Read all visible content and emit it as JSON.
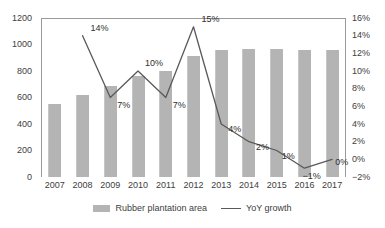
{
  "chart_data": {
    "type": "bar",
    "title": "",
    "xlabel": "",
    "ylabel": "",
    "grid": false,
    "legend_position": "bottom-center",
    "categories": [
      "2007",
      "2008",
      "2009",
      "2010",
      "2011",
      "2012",
      "2013",
      "2014",
      "2015",
      "2016",
      "2017"
    ],
    "axes": {
      "left": {
        "name": "Rubber plantation area",
        "min": 0,
        "max": 1200,
        "step": 200,
        "ticks": [
          "0",
          "200",
          "400",
          "600",
          "800",
          "1000",
          "1200"
        ]
      },
      "right": {
        "name": "YoY growth",
        "min": -2,
        "max": 16,
        "step": 2,
        "ticks": [
          "-2%",
          "0%",
          "2%",
          "4%",
          "6%",
          "8%",
          "10%",
          "12%",
          "14%",
          "16%"
        ]
      }
    },
    "series": [
      {
        "name": "Rubber plantation area",
        "type": "bar",
        "axis": "left",
        "color": "#b4b4b4",
        "values": [
          550,
          620,
          690,
          760,
          800,
          915,
          960,
          965,
          965,
          960,
          960
        ]
      },
      {
        "name": "YoY growth",
        "type": "line",
        "axis": "right",
        "color": "#595959",
        "values": [
          null,
          14,
          7,
          10,
          7,
          15,
          4,
          2,
          1,
          -1,
          0
        ],
        "data_labels": [
          "",
          "14%",
          "7%",
          "10%",
          "7%",
          "15%",
          "4%",
          "2%",
          "1%",
          "-1%",
          "0%"
        ]
      }
    ]
  },
  "legend": {
    "items": [
      {
        "label": "Rubber plantation area",
        "marker": "bar-swatch"
      },
      {
        "label": "YoY growth",
        "marker": "line-swatch"
      }
    ]
  }
}
